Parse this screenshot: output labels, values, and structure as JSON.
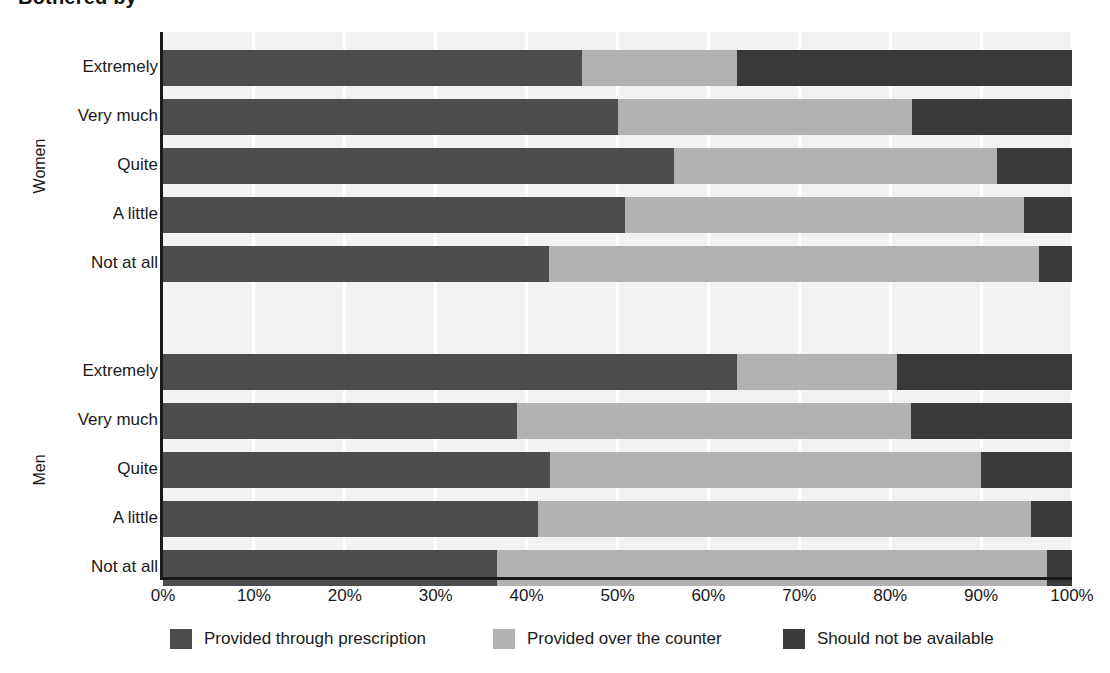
{
  "chart_data": {
    "type": "bar",
    "subtype": "stacked-horizontal-100",
    "title": "Bothered by",
    "xlabel": "",
    "ylabel": "",
    "xlim": [
      0,
      100
    ],
    "x_ticks": [
      "0%",
      "10%",
      "20%",
      "30%",
      "40%",
      "50%",
      "60%",
      "70%",
      "80%",
      "90%",
      "100%"
    ],
    "x_tick_values": [
      0,
      10,
      20,
      30,
      40,
      50,
      60,
      70,
      80,
      90,
      100
    ],
    "grid": "vertical",
    "legend_position": "bottom",
    "legend": [
      "Provided through prescription",
      "Provided over the counter",
      "Should  not be available"
    ],
    "series": [
      {
        "name": "Provided through prescription",
        "color": "#4d4d4d"
      },
      {
        "name": "Provided over the counter",
        "color": "#b2b2b2"
      },
      {
        "name": "Should  not be available",
        "color": "#3a3a3a"
      }
    ],
    "groups": [
      {
        "name": "Women",
        "categories": [
          "Extremely",
          "Very much",
          "Quite",
          "A little",
          "Not at all"
        ],
        "rows": [
          {
            "category": "Extremely",
            "values": [
              46.1,
              17.0,
              36.9
            ]
          },
          {
            "category": "Very much",
            "values": [
              50.1,
              32.3,
              17.6
            ]
          },
          {
            "category": "Quite",
            "values": [
              56.2,
              35.5,
              8.3
            ]
          },
          {
            "category": "A little",
            "values": [
              50.8,
              43.9,
              5.3
            ]
          },
          {
            "category": "Not at all",
            "values": [
              42.5,
              53.9,
              3.6
            ]
          }
        ]
      },
      {
        "name": "Men",
        "categories": [
          "Extremely",
          "Very much",
          "Quite",
          "A little",
          "Not at all"
        ],
        "rows": [
          {
            "category": "Extremely",
            "values": [
              63.2,
              17.6,
              19.2
            ]
          },
          {
            "category": "Very much",
            "values": [
              38.9,
              43.4,
              17.7
            ]
          },
          {
            "category": "Quite",
            "values": [
              42.6,
              47.4,
              10.0
            ]
          },
          {
            "category": "A little",
            "values": [
              41.2,
              54.3,
              4.5
            ]
          },
          {
            "category": "Not at all",
            "values": [
              36.7,
              60.6,
              2.7
            ]
          }
        ]
      }
    ]
  },
  "colors": {
    "prescription": "#4d4d4d",
    "counter": "#b2b2b2",
    "unavailable": "#3a3a3a",
    "plot_background": "#f2f2f2",
    "gridline": "#ffffff",
    "axis": "#1a1a1a"
  }
}
